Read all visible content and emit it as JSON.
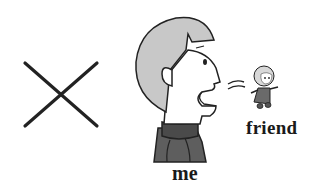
{
  "scene": {
    "description": "Illustration: an X mark, a person in profile shouting toward a small friend figure",
    "labels": {
      "me": "me",
      "friend": "friend"
    },
    "icons": {
      "cross": "x-mark-icon",
      "person": "shouting-person-icon",
      "sound": "sound-waves-icon",
      "friend": "small-friend-figure-icon"
    },
    "colors": {
      "background": "#ffffff",
      "outline": "#222222",
      "hair": "#c8c8c8",
      "skin": "#ffffff",
      "shirt": "#5e5e5e",
      "collar": "#4a4a4a"
    }
  }
}
